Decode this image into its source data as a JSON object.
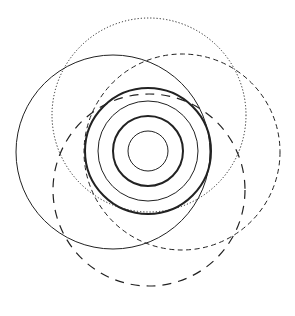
{
  "diagram": {
    "title": "",
    "background": "#ffffff",
    "stroke_color": "#222222",
    "concentric_center": [
      148,
      151
    ],
    "concentric_circles": [
      {
        "name": "ring-1",
        "r": 20,
        "width": 1.0,
        "style": "solid"
      },
      {
        "name": "ring-2",
        "r": 35,
        "width": 2.0,
        "style": "solid"
      },
      {
        "name": "ring-3",
        "r": 50,
        "width": 1.0,
        "style": "solid"
      },
      {
        "name": "ring-4",
        "r": 63,
        "width": 2.0,
        "style": "solid"
      }
    ],
    "outer_circles": [
      {
        "name": "solid-circle",
        "cx": 113,
        "cy": 152,
        "r": 97,
        "width": 1.0,
        "style": "solid"
      },
      {
        "name": "dotted-circle",
        "cx": 149,
        "cy": 115,
        "r": 97,
        "width": 1.0,
        "style": "dotted"
      },
      {
        "name": "short-dashed-circle",
        "cx": 182,
        "cy": 152,
        "r": 98,
        "width": 1.0,
        "style": "short-dash"
      },
      {
        "name": "long-dashed-circle",
        "cx": 149,
        "cy": 190,
        "r": 96,
        "width": 1.2,
        "style": "long-dash"
      }
    ]
  }
}
